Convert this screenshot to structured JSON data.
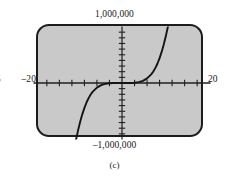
{
  "figure": {
    "caption": "(c)",
    "edge_fragment": "5",
    "labels": {
      "y_max": "1,000,000",
      "y_min": "–1,000,000",
      "x_min": "–20",
      "x_max": "20"
    },
    "colors": {
      "screen_fill": "#c9c9c9",
      "screen_border": "#1c1c1c",
      "axis": "#1f1f1f",
      "curve": "#141414",
      "page_background": "#ffffff",
      "text": "#171717"
    }
  },
  "chart_data": {
    "type": "line",
    "title": "",
    "subtitle": "",
    "xlabel": "",
    "ylabel": "",
    "xlim": [
      -20,
      20
    ],
    "ylim": [
      -1000000,
      1000000
    ],
    "xtick_labels": [
      "–20",
      "20"
    ],
    "ytick_labels": [
      "–1,000,000",
      "1,000,000"
    ],
    "xticks": [
      -18,
      -15,
      -12,
      -9,
      -6,
      -3,
      3,
      6,
      9,
      12,
      15,
      18
    ],
    "yticks": [
      -900000,
      -800000,
      -700000,
      -600000,
      -500000,
      -400000,
      -300000,
      -200000,
      -100000,
      100000,
      200000,
      300000,
      400000,
      500000,
      600000,
      700000,
      800000,
      900000
    ],
    "grid": false,
    "legend": null,
    "axes_style": "centered-cross",
    "series": [
      {
        "name": "odd-degree polynomial",
        "description": "S-shaped odd power curve rising left-to-right through the origin",
        "x": [
          -11.0,
          -10.5,
          -10.0,
          -9.5,
          -9.0,
          -8.5,
          -8.0,
          -7.5,
          -7.0,
          -6.0,
          -5.0,
          -4.0,
          -3.0,
          -2.0,
          -1.0,
          0.0,
          1.0,
          2.0,
          3.0,
          4.0,
          5.0,
          6.0,
          7.0,
          7.5,
          8.0,
          8.5,
          9.0,
          9.5,
          10.0,
          10.5,
          11.0,
          11.5,
          12.0
        ],
        "y": [
          -1000000,
          -830000,
          -680000,
          -550000,
          -440000,
          -345000,
          -268000,
          -204000,
          -153000,
          -82000,
          -38000,
          -15000,
          -4500,
          -1000,
          -150,
          0,
          150,
          1000,
          4500,
          15000,
          38000,
          82000,
          153000,
          204000,
          268000,
          345000,
          440000,
          550000,
          680000,
          830000,
          1000000,
          1190000,
          1400000
        ]
      }
    ]
  }
}
